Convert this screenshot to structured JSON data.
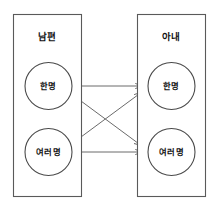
{
  "diagram": {
    "type": "entity-cardinality-diagram",
    "background_color": "#ffffff",
    "line_color": "#6b6b6b",
    "box_stroke_color": "#5a5a5a",
    "text_color": "#111111",
    "entities": [
      {
        "id": "husband",
        "title": "남편",
        "side": "left",
        "nodes": [
          {
            "id": "husband-one",
            "label": "한명"
          },
          {
            "id": "husband-many",
            "label": "여러명"
          }
        ]
      },
      {
        "id": "wife",
        "title": "아내",
        "side": "right",
        "nodes": [
          {
            "id": "wife-one",
            "label": "한명"
          },
          {
            "id": "wife-many",
            "label": "여러명"
          }
        ]
      }
    ],
    "connections": [
      {
        "from": "husband-one",
        "to": "wife-one",
        "arrow": "end"
      },
      {
        "from": "husband-one",
        "to": "wife-many",
        "arrow": "end"
      },
      {
        "from": "husband-many",
        "to": "wife-one",
        "arrow": "end"
      },
      {
        "from": "husband-many",
        "to": "wife-many",
        "arrow": "end"
      }
    ]
  }
}
